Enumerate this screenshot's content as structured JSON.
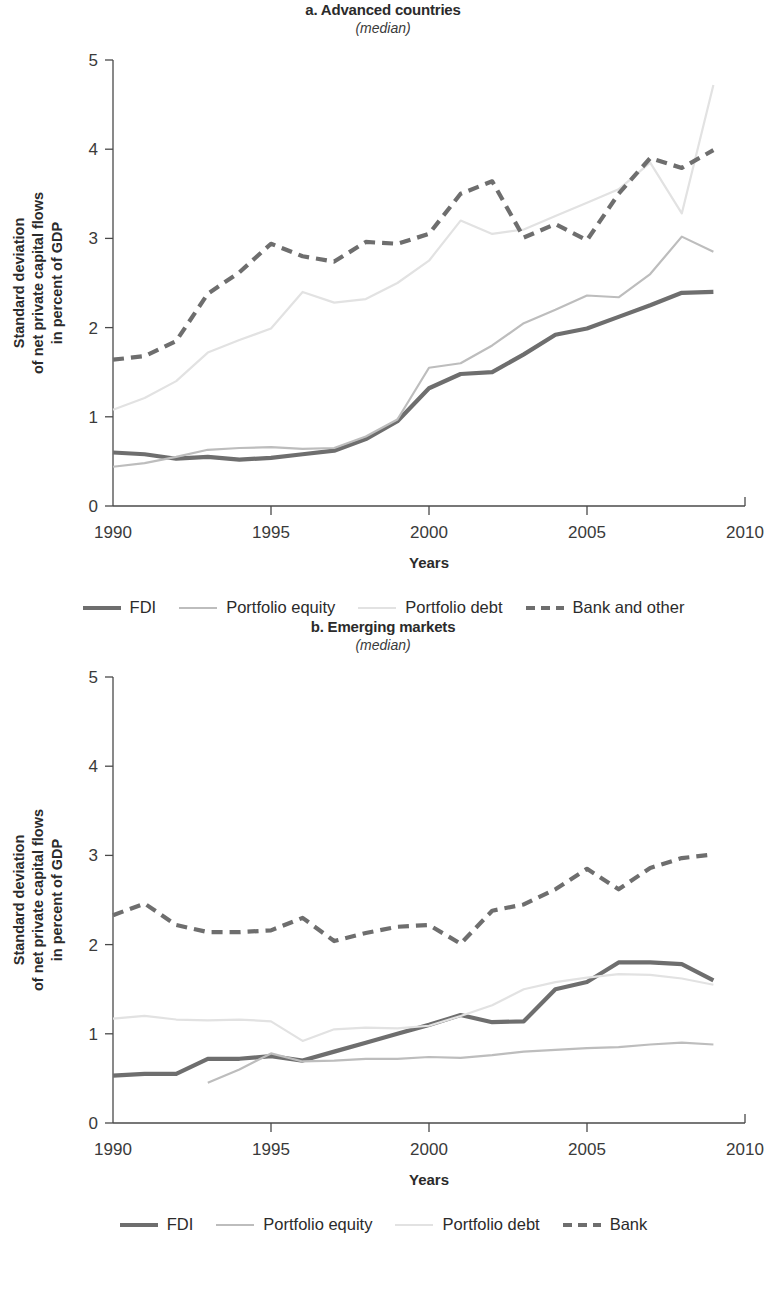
{
  "figure": {
    "series_styles": {
      "fdi": {
        "color": "#6e6e6e",
        "width": 4.2,
        "dash": "none"
      },
      "equity": {
        "color": "#bdbdbd",
        "width": 2.2,
        "dash": "none"
      },
      "debt": {
        "color": "#e2e2e2",
        "width": 2.2,
        "dash": "none"
      },
      "bank": {
        "color": "#6e6e6e",
        "width": 4.2,
        "dash": "11,7"
      }
    },
    "axis_color": "#4a4a4a"
  },
  "panels": [
    {
      "id": "advanced-countries",
      "title": "a. Advanced countries",
      "subtitle": "(median)",
      "ylabel_line1": "Standard deviation",
      "ylabel_line2": "of net private capital flows",
      "ylabel_line3": "in percent of GDP",
      "xlabel": "Years",
      "legend": [
        {
          "key": "fdi",
          "label": "FDI",
          "swatch": "solid-thick-dark"
        },
        {
          "key": "equity",
          "label": "Portfolio equity",
          "swatch": "solid-thin-mid"
        },
        {
          "key": "debt",
          "label": "Portfolio debt",
          "swatch": "solid-thin-light"
        },
        {
          "key": "bank",
          "label": "Bank and other",
          "swatch": "dashed-thick-dark"
        }
      ],
      "chart_data": {
        "type": "line",
        "title": "a. Advanced countries",
        "subtitle": "(median)",
        "xlabel": "Years",
        "ylabel": "Standard deviation of net private capital flows in percent of GDP",
        "xlim": [
          1990,
          2010
        ],
        "ylim": [
          0,
          5
        ],
        "xticks": [
          1990,
          1995,
          2000,
          2005,
          2010
        ],
        "xtick_labels": [
          "1990",
          "1995",
          "2000",
          "2005",
          "2010"
        ],
        "yticks": [
          0,
          1,
          2,
          3,
          4,
          5
        ],
        "ytick_labels": [
          "0",
          "1",
          "2",
          "3",
          "4",
          "5"
        ],
        "grid": false,
        "legend_position": "below",
        "x": [
          1990,
          1991,
          1992,
          1993,
          1994,
          1995,
          1996,
          1997,
          1998,
          1999,
          2000,
          2001,
          2002,
          2003,
          2004,
          2005,
          2006,
          2007,
          2008,
          2009
        ],
        "series": [
          {
            "name": "FDI",
            "key": "fdi",
            "values": [
              0.6,
              0.58,
              0.53,
              0.55,
              0.52,
              0.54,
              0.58,
              0.62,
              0.75,
              0.95,
              1.32,
              1.48,
              1.5,
              1.7,
              1.92,
              1.99,
              2.12,
              2.25,
              2.39,
              2.4
            ]
          },
          {
            "name": "Portfolio equity",
            "key": "equity",
            "values": [
              0.44,
              0.48,
              0.55,
              0.63,
              0.65,
              0.66,
              0.64,
              0.65,
              0.78,
              0.97,
              1.55,
              1.6,
              1.8,
              2.05,
              2.2,
              2.36,
              2.34,
              2.6,
              3.02,
              2.85
            ]
          },
          {
            "name": "Portfolio debt",
            "key": "debt",
            "values": [
              1.08,
              1.21,
              1.4,
              1.72,
              1.86,
              1.99,
              2.4,
              2.28,
              2.32,
              2.5,
              2.75,
              3.2,
              3.05,
              3.1,
              3.25,
              3.4,
              3.55,
              3.85,
              3.28,
              4.72
            ]
          },
          {
            "name": "Bank and other",
            "key": "bank",
            "values": [
              1.64,
              1.68,
              1.85,
              2.38,
              2.62,
              2.94,
              2.8,
              2.74,
              2.96,
              2.94,
              3.05,
              3.5,
              3.64,
              3.01,
              3.16,
              2.98,
              3.5,
              3.9,
              3.79,
              3.99
            ]
          }
        ]
      }
    },
    {
      "id": "emerging-markets",
      "title": "b. Emerging markets",
      "subtitle": "(median)",
      "ylabel_line1": "Standard deviation",
      "ylabel_line2": "of net private capital flows",
      "ylabel_line3": "in percent of GDP",
      "xlabel": "Years",
      "legend": [
        {
          "key": "fdi",
          "label": "FDI",
          "swatch": "solid-thick-dark"
        },
        {
          "key": "equity",
          "label": "Portfolio equity",
          "swatch": "solid-thin-mid"
        },
        {
          "key": "debt",
          "label": "Portfolio debt",
          "swatch": "solid-thin-light"
        },
        {
          "key": "bank",
          "label": "Bank",
          "swatch": "dashed-thick-dark"
        }
      ],
      "chart_data": {
        "type": "line",
        "title": "b. Emerging markets",
        "subtitle": "(median)",
        "xlabel": "Years",
        "ylabel": "Standard deviation of net private capital flows in percent of GDP",
        "xlim": [
          1990,
          2010
        ],
        "ylim": [
          0,
          5
        ],
        "xticks": [
          1990,
          1995,
          2000,
          2005,
          2010
        ],
        "xtick_labels": [
          "1990",
          "1995",
          "2000",
          "2005",
          "2010"
        ],
        "yticks": [
          0,
          1,
          2,
          3,
          4,
          5
        ],
        "ytick_labels": [
          "0",
          "1",
          "2",
          "3",
          "4",
          "5"
        ],
        "grid": false,
        "legend_position": "below",
        "x": [
          1990,
          1991,
          1992,
          1993,
          1994,
          1995,
          1996,
          1997,
          1998,
          1999,
          2000,
          2001,
          2002,
          2003,
          2004,
          2005,
          2006,
          2007,
          2008,
          2009
        ],
        "series": [
          {
            "name": "FDI",
            "key": "fdi",
            "values": [
              0.53,
              0.55,
              0.55,
              0.72,
              0.72,
              0.75,
              0.7,
              0.8,
              0.9,
              1.0,
              1.1,
              1.21,
              1.13,
              1.14,
              1.5,
              1.58,
              1.8,
              1.8,
              1.78,
              1.6
            ]
          },
          {
            "name": "Portfolio equity",
            "key": "equity",
            "x": [
              1993,
              1994,
              1995,
              1996,
              1997,
              1998,
              1999,
              2000,
              2001,
              2002,
              2003,
              2004,
              2005,
              2006,
              2007,
              2008,
              2009
            ],
            "values": [
              0.45,
              0.6,
              0.78,
              0.69,
              0.7,
              0.72,
              0.72,
              0.74,
              0.73,
              0.76,
              0.8,
              0.82,
              0.84,
              0.85,
              0.88,
              0.9,
              0.88
            ]
          },
          {
            "name": "Portfolio debt",
            "key": "debt",
            "values": [
              1.17,
              1.2,
              1.16,
              1.15,
              1.16,
              1.14,
              0.92,
              1.05,
              1.07,
              1.06,
              1.09,
              1.2,
              1.32,
              1.5,
              1.58,
              1.63,
              1.67,
              1.66,
              1.62,
              1.55
            ]
          },
          {
            "name": "Bank",
            "key": "bank",
            "values": [
              2.33,
              2.46,
              2.22,
              2.14,
              2.14,
              2.16,
              2.3,
              2.04,
              2.13,
              2.2,
              2.22,
              2.01,
              2.38,
              2.45,
              2.62,
              2.85,
              2.62,
              2.86,
              2.97,
              3.01
            ]
          }
        ]
      }
    }
  ]
}
